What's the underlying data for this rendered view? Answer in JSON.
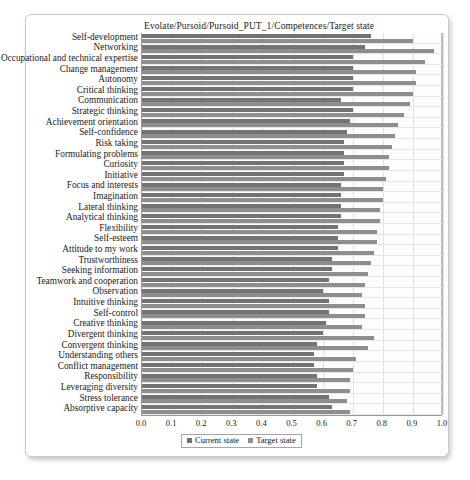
{
  "chart_data": {
    "type": "bar",
    "orientation": "horizontal",
    "title": "Evolate/Pursoid/Pursoid_PUT_1/Competences/Target state",
    "xlabel": "",
    "ylabel": "",
    "xlim": [
      0.0,
      1.0
    ],
    "xticks": [
      "0.0",
      "0.1",
      "0.2",
      "0.3",
      "0.4",
      "0.5",
      "0.6",
      "0.7",
      "0.8",
      "0.9",
      "1.0"
    ],
    "grid": true,
    "legend_position": "bottom-center",
    "legend": [
      "Current state",
      "Target state"
    ],
    "categories": [
      "Self-development",
      "Networking",
      "Occupational and technical expertise",
      "Change management",
      "Autonomy",
      "Critical thinking",
      "Communication",
      "Strategic thinking",
      "Achievement orientation",
      "Self-confidence",
      "Risk taking",
      "Formulating problems",
      "Curiosity",
      "Initiative",
      "Focus and interests",
      "Imagination",
      "Lateral thinking",
      "Analytical thinking",
      "Flexibility",
      "Self-esteem",
      "Attitude to my work",
      "Trustworthiness",
      "Seeking information",
      "Teamwork and cooperation",
      "Observation",
      "Intuitive thinking",
      "Self-control",
      "Creative thinking",
      "Divergent thinking",
      "Convergent thinking",
      "Understanding others",
      "Conflict management",
      "Responsibility",
      "Leveraging diversity",
      "Stress tolerance",
      "Absorptive capacity"
    ],
    "series": [
      {
        "name": "Current state",
        "color": "#737373",
        "values": [
          0.76,
          0.74,
          0.7,
          0.7,
          0.7,
          0.7,
          0.66,
          0.7,
          0.69,
          0.68,
          0.67,
          0.67,
          0.67,
          0.67,
          0.66,
          0.66,
          0.66,
          0.66,
          0.65,
          0.65,
          0.65,
          0.63,
          0.63,
          0.62,
          0.6,
          0.62,
          0.62,
          0.61,
          0.6,
          0.58,
          0.57,
          0.57,
          0.58,
          0.58,
          0.62,
          0.63
        ]
      },
      {
        "name": "Target state",
        "color": "#8e8e8e",
        "values": [
          0.9,
          0.97,
          0.94,
          0.91,
          0.91,
          0.9,
          0.89,
          0.87,
          0.85,
          0.84,
          0.83,
          0.82,
          0.82,
          0.81,
          0.8,
          0.8,
          0.79,
          0.79,
          0.78,
          0.78,
          0.77,
          0.76,
          0.75,
          0.74,
          0.73,
          0.74,
          0.74,
          0.73,
          0.77,
          0.75,
          0.71,
          0.7,
          0.69,
          0.69,
          0.68,
          0.69
        ]
      }
    ]
  },
  "caption": ""
}
